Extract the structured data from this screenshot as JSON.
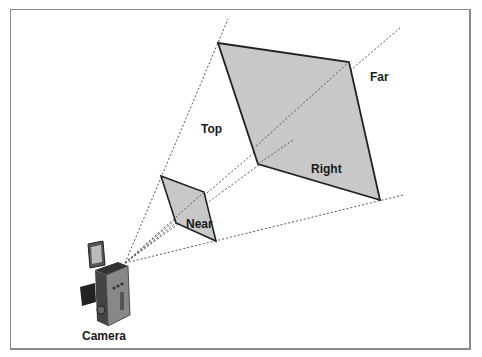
{
  "diagram": {
    "type": "view-frustum",
    "labels": {
      "top": "Top",
      "far": "Far",
      "right": "Right",
      "near": "Near",
      "camera": "Camera"
    },
    "colors": {
      "plane_fill": "#c8c8c8",
      "plane_stroke": "#222222",
      "ray": "#555555",
      "frame_border": "#8a8a8a"
    }
  }
}
